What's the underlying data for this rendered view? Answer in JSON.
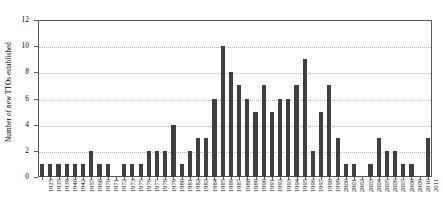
{
  "chart_data": {
    "type": "bar",
    "title": "",
    "subtitle": "",
    "xlabel": "",
    "ylabel": "Number of new TTOs established",
    "ylim": [
      0,
      12
    ],
    "ytick_values": [
      0,
      2,
      4,
      6,
      8,
      10,
      12
    ],
    "ytick_labels": [
      "0",
      "2",
      "4",
      "6",
      "8",
      "10",
      "12"
    ],
    "grid": "horizontal-dotted",
    "legend": "none",
    "bar_color": "#3f3f41",
    "axis_color": "#58585a",
    "grid_color": "#b8b8b8",
    "categories": [
      "1925",
      "1935",
      "1939",
      "1940",
      "1942",
      "1957",
      "1968",
      "1970",
      "1971",
      "1972",
      "1973",
      "1975",
      "1976",
      "1977",
      "1978",
      "1979",
      "1980",
      "1981",
      "1982",
      "1983",
      "1984",
      "1985",
      "1986",
      "1987",
      "1988",
      "1989",
      "1990",
      "1991",
      "1992",
      "1993",
      "1994",
      "1995",
      "1996",
      "1997",
      "1998",
      "1999",
      "2000",
      "2001",
      "2002",
      "2003",
      "2004",
      "2005",
      "2006",
      "2007",
      "2008",
      "2009",
      "2010",
      "2011"
    ],
    "values": [
      1,
      1,
      1,
      1,
      1,
      1,
      2,
      1,
      1,
      0,
      1,
      1,
      1,
      2,
      2,
      2,
      4,
      1,
      2,
      3,
      3,
      6,
      10,
      8,
      7,
      6,
      5,
      7,
      5,
      6,
      6,
      7,
      9,
      2,
      5,
      7,
      3,
      1,
      1,
      0,
      1,
      3,
      2,
      2,
      1,
      1,
      0,
      3
    ]
  }
}
